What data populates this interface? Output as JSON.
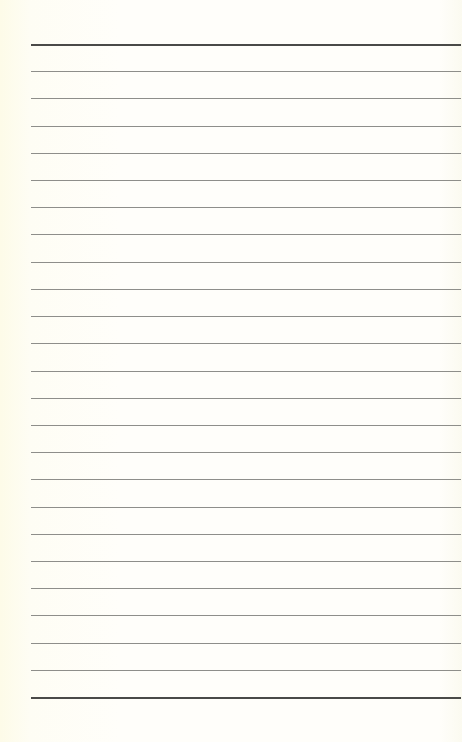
{
  "page": {
    "type": "lined-notebook-page",
    "background_color": "#fefdf3",
    "line_color": "#8e8e8a",
    "border_line_color": "#4a4a48",
    "top_border_y": 44,
    "bottom_border_y": 697,
    "line_spacing": 27.2,
    "line_left": 31,
    "line_width": 430,
    "thin_line_count": 23
  }
}
